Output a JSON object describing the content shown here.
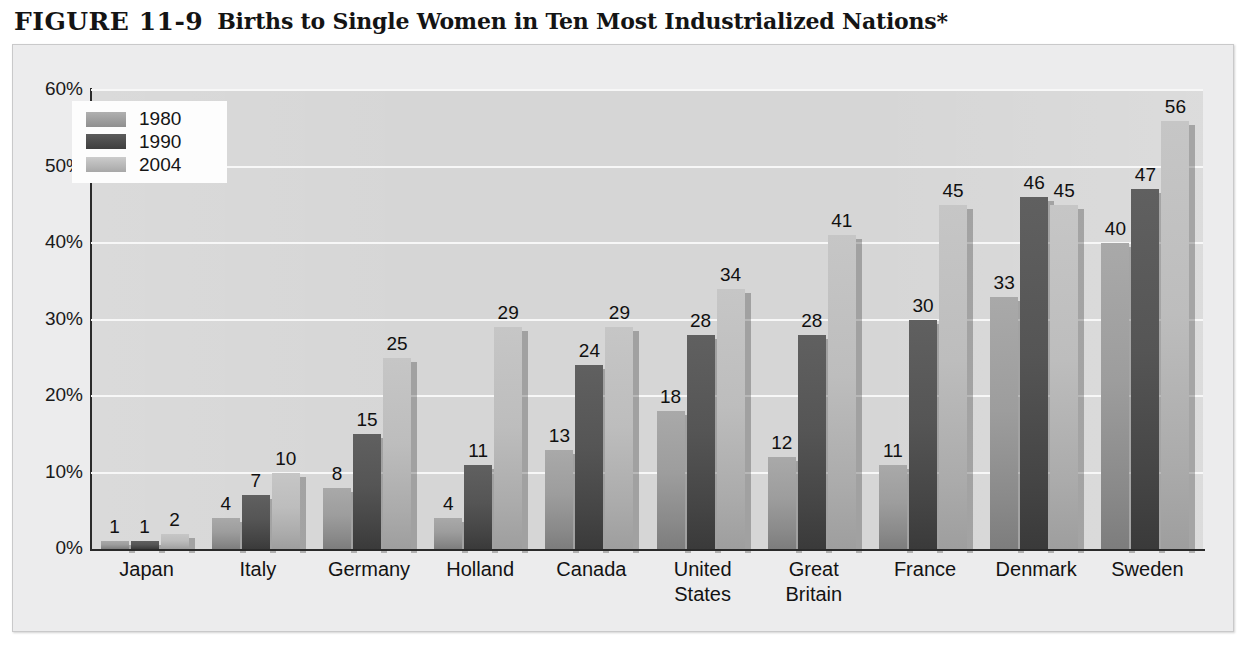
{
  "figure": {
    "number": "FIGURE 11-9",
    "title": "Births to Single Women in Ten Most Industrialized Nations*"
  },
  "legend": {
    "position": "top-left-inside-plot",
    "entries": [
      {
        "label": "1980",
        "swatch": "legend-swatch-1980",
        "color": "#9d9d9d"
      },
      {
        "label": "1990",
        "swatch": "legend-swatch-1990",
        "color": "#4d4d4d"
      },
      {
        "label": "2004",
        "swatch": "legend-swatch-2004",
        "color": "#bdbdbd"
      }
    ]
  },
  "axis": {
    "y_ticks": [
      "60%",
      "50%",
      "40%",
      "30%",
      "20%",
      "10%",
      "0%"
    ]
  },
  "colors": {
    "panel_background": "#ececed",
    "plot_background": "#d6d6d6",
    "gridline": "#f7f7f7",
    "axis_line": "#2a2a2a",
    "series_1980": "#9d9d9d",
    "series_1990": "#4d4d4d",
    "series_2004": "#bdbdbd",
    "text": "#131313"
  },
  "chart_data": {
    "type": "bar",
    "title": "Births to Single Women in Ten Most Industrialized Nations*",
    "xlabel": "",
    "ylabel": "",
    "ylim": [
      0,
      60
    ],
    "ytick_labels": [
      "0%",
      "10%",
      "20%",
      "30%",
      "40%",
      "50%",
      "60%"
    ],
    "ytick_values": [
      0,
      10,
      20,
      30,
      40,
      50,
      60
    ],
    "grid": "horizontal",
    "legend_position": "upper left",
    "value_labels": true,
    "units": "percent",
    "categories": [
      "Japan",
      "Italy",
      "Germany",
      "Holland",
      "Canada",
      "United States",
      "Great Britain",
      "France",
      "Denmark",
      "Sweden"
    ],
    "category_labels": [
      [
        "Japan"
      ],
      [
        "Italy"
      ],
      [
        "Germany"
      ],
      [
        "Holland"
      ],
      [
        "Canada"
      ],
      [
        "United",
        "States"
      ],
      [
        "Great",
        "Britain"
      ],
      [
        "France"
      ],
      [
        "Denmark"
      ],
      [
        "Sweden"
      ]
    ],
    "series": [
      {
        "name": "1980",
        "values": [
          1,
          4,
          8,
          4,
          13,
          18,
          12,
          11,
          33,
          40
        ]
      },
      {
        "name": "1990",
        "values": [
          1,
          7,
          15,
          11,
          24,
          28,
          28,
          30,
          46,
          47
        ]
      },
      {
        "name": "2004",
        "values": [
          2,
          10,
          25,
          29,
          29,
          34,
          41,
          45,
          45,
          56
        ]
      }
    ]
  }
}
